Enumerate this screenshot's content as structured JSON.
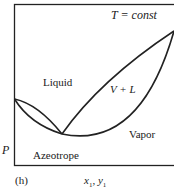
{
  "figure": {
    "panel_label": "(h)",
    "condition": "T = const",
    "y_axis_label": "P",
    "x_axis_label": {
      "base1": "x",
      "sub1": "1",
      "sep": ", ",
      "base2": "y",
      "sub2": "1"
    },
    "regions": {
      "liquid": "Liquid",
      "two_phase": "V + L",
      "vapor": "Vapor",
      "azeotrope": "Azeotrope"
    }
  }
}
